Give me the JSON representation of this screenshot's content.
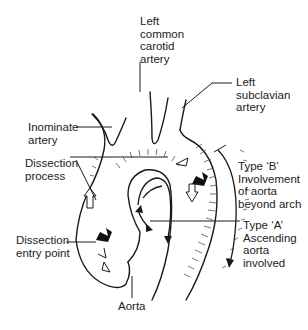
{
  "diagram": {
    "labels": {
      "left_common_carotid": "Left\ncommon\ncarotid\nartery",
      "left_subclavian": "Left\nsubclavian\nartery",
      "inominate": "Inominate\nartery",
      "dissection_process": "Dissection\nprocess",
      "type_b": "Type ‘B’\nInvolvement\nof aorta\nbeyond arch",
      "type_a": "Type ‘A’\nAscending\naorta\ninvolved",
      "dissection_entry": "Dissection\nentry point",
      "aorta": "Aorta"
    },
    "colors": {
      "line": "#1a1a1a",
      "text": "#222222",
      "background": "#ffffff"
    }
  }
}
